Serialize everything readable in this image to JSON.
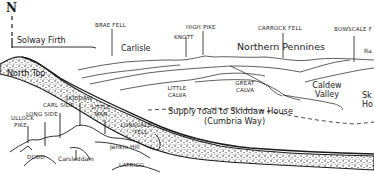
{
  "diagram": {
    "type": "hand-drawn mountain panorama",
    "compass": {
      "label": "N"
    },
    "labels": {
      "solway_firth": "Solway Firth",
      "north_top": "North Top",
      "brae_fell": "BRAE FELL",
      "carlisle": "Carlisle",
      "knott": "KNOTT",
      "high_pike": "HIGH PIKE",
      "carrock_fell": "CARROCK FELL",
      "northern_pennines": "Northern Pennines",
      "bowscale_fell": "BOWSCALE FELL",
      "bowscale_fell_visible": "BOWSCALE F",
      "right_edge_peak": "Ra",
      "little_calva_1": "LITTLE",
      "little_calva_2": "CALVA",
      "great_calva_1": "GREAT",
      "great_calva_2": "CALVA",
      "caldew_valley_1": "Caldew",
      "caldew_valley_2": "Valley",
      "skiddaw_house_1": "Sk",
      "skiddaw_house_2": "Ho",
      "supply_road_1": "Supply road to Skiddaw House",
      "supply_road_2": "(Cumbria Way)",
      "ullock_pike_1": "ULLOCK",
      "ullock_pike_2": "PIKE",
      "ullock_pike_visible_1": "ULLOCK",
      "long_side": "LONG SIDE",
      "carl_side": "CARL SIDE",
      "skiddaw": "SKIDDAW",
      "little_man_1": "LITTLE",
      "little_man_2": "MAN",
      "lonscale_fell_1": "LONSCALE",
      "lonscale_fell_2": "FELL",
      "jenkin_hill": "Jenkin Hill",
      "dodd": "DODD",
      "latrigg": "LATRIGG",
      "carsleddam": "Carsleddam"
    },
    "colors": {
      "ink": "#1a1a1a",
      "background": "#ffffff"
    }
  }
}
